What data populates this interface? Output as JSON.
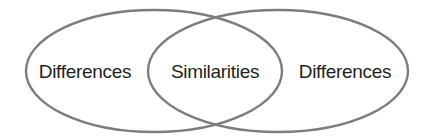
{
  "diagram": {
    "type": "venn",
    "sets": [
      {
        "id": "left",
        "label": "Differences"
      },
      {
        "id": "right",
        "label": "Differences"
      }
    ],
    "intersection": {
      "label": "Similarities"
    },
    "colors": {
      "stroke": "#7d7d7d",
      "text": "#231f20",
      "background": "#ffffff"
    }
  }
}
